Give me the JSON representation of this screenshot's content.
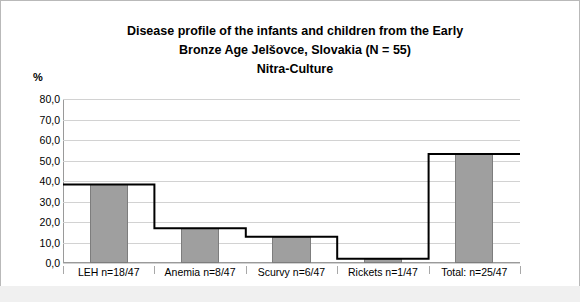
{
  "chart_data": {
    "type": "bar",
    "title": "Disease profile of the infants and children from the Early Bronze Age Jelšovce, Slovakia (N = 55) Nitra-Culture",
    "title_lines": [
      "Disease profile of the infants and children from the Early",
      "Bronze Age Jelšovce, Slovakia (N = 55)",
      "Nitra-Culture"
    ],
    "categories": [
      "LEH n=18/47",
      "Anemia n=8/47",
      "Scurvy n=6/47",
      "Rickets n=1/47",
      "Total: n=25/47"
    ],
    "values": [
      38.3,
      17.0,
      12.8,
      2.1,
      53.2
    ],
    "series": [
      {
        "name": "percent affected",
        "values": [
          38.3,
          17.0,
          12.8,
          2.1,
          53.2
        ]
      }
    ],
    "xlabel": "",
    "ylabel": "%",
    "ylim": [
      0,
      80
    ],
    "ytick_labels": [
      "0,0",
      "10,0",
      "20,0",
      "30,0",
      "40,0",
      "50,0",
      "60,0",
      "70,0",
      "80,0"
    ],
    "ytick_values": [
      0,
      10,
      20,
      30,
      40,
      50,
      60,
      70,
      80
    ],
    "grid": true,
    "legend": "none",
    "bar_color": "#9f9f9f",
    "bar_border_color": "#7d7d7d",
    "step_line_color": "#000000",
    "grid_color": "#d2d2d2",
    "axis_color": "#9a9a9a",
    "background": "#ffffff"
  }
}
